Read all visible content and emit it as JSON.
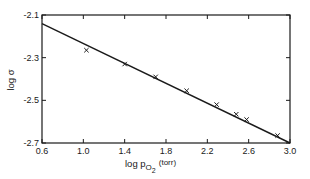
{
  "chart_data": {
    "type": "scatter",
    "title": "",
    "xlabel": "log p_O2 (torr)",
    "xlabel_parts": {
      "main": "log p",
      "sub": "O",
      "sub2": "2",
      "unit": "(torr)"
    },
    "ylabel": "log σ",
    "xlim": [
      0.6,
      3.0
    ],
    "ylim": [
      -2.7,
      -2.1
    ],
    "x_ticks": [
      0.6,
      1.0,
      1.4,
      1.8,
      2.2,
      2.6,
      3.0
    ],
    "x_tick_labels": [
      "0.6",
      "1.0",
      "1.4",
      "1.8",
      "2.2",
      "2.6",
      "3.0"
    ],
    "y_ticks": [
      -2.1,
      -2.3,
      -2.5,
      -2.7
    ],
    "y_tick_labels": [
      "-2.1",
      "-2.3",
      "-2.5",
      "-2.7"
    ],
    "grid": false,
    "legend": null,
    "series": [
      {
        "name": "measured",
        "marker": "x",
        "x": [
          1.03,
          1.4,
          1.7,
          2.0,
          2.29,
          2.48,
          2.58,
          2.88
        ],
        "y": [
          -2.265,
          -2.33,
          -2.39,
          -2.455,
          -2.52,
          -2.565,
          -2.59,
          -2.665
        ]
      },
      {
        "name": "fit line",
        "type": "line",
        "x": [
          0.6,
          3.0
        ],
        "y": [
          -2.14,
          -2.7
        ]
      }
    ]
  },
  "colors": {
    "ink": "#1a1a1a",
    "background": "#ffffff"
  }
}
